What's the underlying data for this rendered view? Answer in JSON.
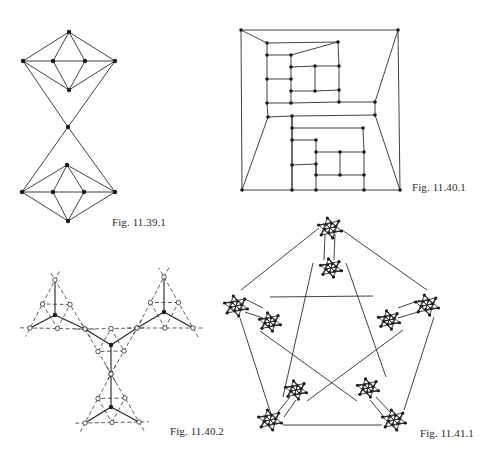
{
  "page": {
    "background": "#ffffff",
    "ink_color": "#2b2b2b"
  },
  "figures": [
    {
      "id": "fig-11-39-1",
      "caption": "Fig. 11.39.1",
      "caption_pos": [
        112,
        216
      ],
      "vertices": [
        [
          69,
          32
        ],
        [
          23,
          61
        ],
        [
          53,
          61
        ],
        [
          85,
          61
        ],
        [
          115,
          61
        ],
        [
          69,
          90
        ],
        [
          68,
          127
        ],
        [
          67,
          165
        ],
        [
          22,
          192
        ],
        [
          53,
          192
        ],
        [
          84,
          192
        ],
        [
          115,
          192
        ],
        [
          68,
          221
        ]
      ],
      "edges": [
        [
          0,
          1
        ],
        [
          0,
          2
        ],
        [
          0,
          3
        ],
        [
          0,
          4
        ],
        [
          1,
          2
        ],
        [
          2,
          3
        ],
        [
          3,
          4
        ],
        [
          1,
          5
        ],
        [
          2,
          5
        ],
        [
          3,
          5
        ],
        [
          4,
          5
        ],
        [
          1,
          6
        ],
        [
          4,
          6
        ],
        [
          6,
          8
        ],
        [
          6,
          11
        ],
        [
          7,
          8
        ],
        [
          7,
          9
        ],
        [
          7,
          10
        ],
        [
          7,
          11
        ],
        [
          8,
          9
        ],
        [
          9,
          10
        ],
        [
          10,
          11
        ],
        [
          8,
          12
        ],
        [
          9,
          12
        ],
        [
          10,
          12
        ],
        [
          11,
          12
        ]
      ]
    },
    {
      "id": "fig-11-40-1",
      "caption": "Fig. 11.40.1",
      "caption_pos": [
        412,
        181
      ],
      "vertices": [
        [
          241,
          30
        ],
        [
          398,
          30
        ],
        [
          242,
          190
        ],
        [
          400,
          190
        ],
        [
          267,
          43
        ],
        [
          338,
          42
        ],
        [
          267,
          55
        ],
        [
          291,
          55
        ],
        [
          291,
          67
        ],
        [
          315,
          66
        ],
        [
          339,
          66
        ],
        [
          267,
          79
        ],
        [
          291,
          79
        ],
        [
          291,
          91
        ],
        [
          315,
          91
        ],
        [
          339,
          90
        ],
        [
          267,
          103
        ],
        [
          291,
          103
        ],
        [
          339,
          102
        ],
        [
          375,
          102
        ],
        [
          268,
          117
        ],
        [
          292,
          116
        ],
        [
          375,
          115
        ],
        [
          292,
          128
        ],
        [
          363,
          128
        ],
        [
          292,
          140
        ],
        [
          316,
          140
        ],
        [
          316,
          152
        ],
        [
          340,
          152
        ],
        [
          364,
          152
        ],
        [
          292,
          165
        ],
        [
          316,
          164
        ],
        [
          316,
          175
        ],
        [
          340,
          175
        ],
        [
          364,
          175
        ],
        [
          292,
          190
        ],
        [
          316,
          190
        ],
        [
          364,
          190
        ]
      ],
      "edges": [
        [
          0,
          1
        ],
        [
          0,
          2
        ],
        [
          1,
          3
        ],
        [
          2,
          3
        ],
        [
          0,
          4
        ],
        [
          4,
          5
        ],
        [
          4,
          6
        ],
        [
          6,
          7
        ],
        [
          7,
          5
        ],
        [
          6,
          11
        ],
        [
          11,
          16
        ],
        [
          16,
          17
        ],
        [
          7,
          8
        ],
        [
          8,
          12
        ],
        [
          12,
          13
        ],
        [
          13,
          17
        ],
        [
          11,
          12
        ],
        [
          8,
          9
        ],
        [
          9,
          10
        ],
        [
          10,
          5
        ],
        [
          9,
          14
        ],
        [
          13,
          14
        ],
        [
          14,
          15
        ],
        [
          10,
          15
        ],
        [
          15,
          18
        ],
        [
          17,
          18
        ],
        [
          18,
          19
        ],
        [
          19,
          1
        ],
        [
          19,
          22
        ],
        [
          20,
          21
        ],
        [
          21,
          22
        ],
        [
          16,
          20
        ],
        [
          20,
          2
        ],
        [
          22,
          3
        ],
        [
          21,
          23
        ],
        [
          23,
          24
        ],
        [
          23,
          25
        ],
        [
          25,
          26
        ],
        [
          25,
          30
        ],
        [
          30,
          31
        ],
        [
          26,
          27
        ],
        [
          27,
          28
        ],
        [
          28,
          29
        ],
        [
          24,
          29
        ],
        [
          27,
          31
        ],
        [
          31,
          32
        ],
        [
          32,
          33
        ],
        [
          33,
          34
        ],
        [
          29,
          34
        ],
        [
          28,
          33
        ],
        [
          34,
          37
        ],
        [
          31,
          36
        ],
        [
          30,
          35
        ],
        [
          21,
          35
        ]
      ]
    },
    {
      "id": "fig-11-40-2",
      "caption": "Fig. 11.40.2",
      "caption_pos": [
        170,
        425
      ],
      "hubs": [
        {
          "center": [
            55,
            315
          ],
          "top": [
            55,
            280
          ],
          "left": [
            30,
            328
          ],
          "right": [
            85,
            329
          ]
        },
        {
          "center": [
            164,
            312
          ],
          "top": [
            164,
            277
          ],
          "left": [
            137,
            328
          ],
          "right": [
            193,
            328
          ]
        },
        {
          "center": [
            111,
            345
          ],
          "top": [
            111,
            374
          ],
          "left": [
            85,
            329
          ],
          "right": [
            137,
            328
          ]
        },
        {
          "center": [
            111,
            407
          ],
          "top": [
            111,
            374
          ],
          "left": [
            85,
            423
          ],
          "right": [
            139,
            422
          ]
        }
      ]
    },
    {
      "id": "fig-11-41-1",
      "caption": "Fig. 11.41.1",
      "caption_pos": [
        420,
        427
      ],
      "outer_clusters": [
        [
          330,
          228
        ],
        [
          236,
          306
        ],
        [
          427,
          305
        ],
        [
          270,
          420
        ],
        [
          394,
          420
        ]
      ],
      "inner_clusters": [
        [
          331,
          268
        ],
        [
          270,
          322
        ],
        [
          389,
          320
        ],
        [
          296,
          390
        ],
        [
          368,
          388
        ]
      ],
      "outer_edges": [
        [
          [
            319,
            228
          ],
          [
            241,
            290
          ]
        ],
        [
          [
            342,
            230
          ],
          [
            427,
            290
          ]
        ],
        [
          [
            240,
            318
          ],
          [
            271,
            414
          ]
        ],
        [
          [
            434,
            317
          ],
          [
            404,
            410
          ]
        ],
        [
          [
            283,
            425
          ],
          [
            382,
            425
          ]
        ]
      ],
      "inner_star_edges": [
        [
          [
            313,
            263
          ],
          [
            283,
            397
          ]
        ],
        [
          [
            346,
            263
          ],
          [
            386,
            377
          ]
        ],
        [
          [
            270,
            297
          ],
          [
            373,
            296
          ]
        ],
        [
          [
            260,
            331
          ],
          [
            357,
            401
          ]
        ],
        [
          [
            403,
            330
          ],
          [
            307,
            401
          ]
        ]
      ],
      "bridges": [
        [
          [
            325,
            234
          ],
          [
            324,
            260
          ]
        ],
        [
          [
            335,
            234
          ],
          [
            334,
            260
          ]
        ],
        [
          [
            243,
            298
          ],
          [
            263,
            308
          ]
        ],
        [
          [
            245,
            312
          ],
          [
            263,
            318
          ]
        ],
        [
          [
            420,
            300
          ],
          [
            398,
            308
          ]
        ],
        [
          [
            418,
            312
          ],
          [
            398,
            318
          ]
        ],
        [
          [
            278,
            412
          ],
          [
            290,
            397
          ]
        ],
        [
          [
            284,
            417
          ],
          [
            296,
            400
          ]
        ],
        [
          [
            390,
            412
          ],
          [
            376,
            397
          ]
        ],
        [
          [
            384,
            417
          ],
          [
            370,
            400
          ]
        ]
      ]
    }
  ]
}
